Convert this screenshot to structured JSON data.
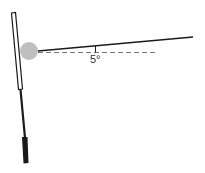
{
  "diagram": {
    "angle_label": "5°",
    "colors": {
      "stroke": "#1a1a1a",
      "ball": "#bfbfbf",
      "dashed": "#777777",
      "background": "#ffffff"
    }
  }
}
